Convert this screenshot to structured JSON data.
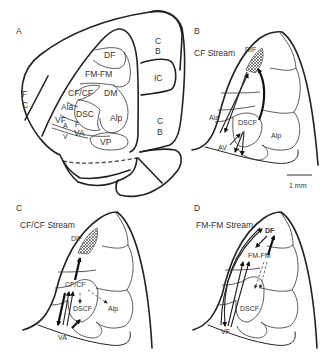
{
  "panels": {
    "A": {
      "letter": "A",
      "regions": {
        "df": "DF",
        "fmfm": "FM-FM",
        "cfcf": "CF/CF",
        "dm": "DM",
        "ala": "Ala",
        "dsc": "DSC",
        "f": "F",
        "alp": "Alp",
        "vf": "VF",
        "a": "A",
        "v": "V",
        "va": "VA",
        "vp": "VP"
      },
      "structures": {
        "fc_f": "F",
        "fc_c": "C",
        "cb_top_c": "C",
        "cb_top_b": "B",
        "ic": "IC",
        "cb_bot_c": "C",
        "cb_bot_b": "B"
      }
    },
    "B": {
      "letter": "B",
      "title": "CF Stream",
      "regions": {
        "dif": "DIF",
        "ala": "Ala",
        "dscf": "DSCF",
        "alp": "Alp",
        "av": "AV"
      }
    },
    "scale_bar": {
      "label": "1 mm"
    },
    "C": {
      "letter": "C",
      "title": "CF/CF Stream",
      "regions": {
        "dif": "DIF",
        "cfcf": "CF/CF",
        "dscf": "DSCF",
        "alp": "Alp",
        "va": "VA"
      }
    },
    "D": {
      "letter": "D",
      "title": "FM-FM Stream",
      "regions": {
        "df": "DF",
        "fmfm": "FM-FM",
        "dscf": "DSCF",
        "vf": "VF"
      }
    }
  },
  "colors": {
    "outline": "#222222",
    "text": "#333333",
    "background": "#ffffff"
  }
}
